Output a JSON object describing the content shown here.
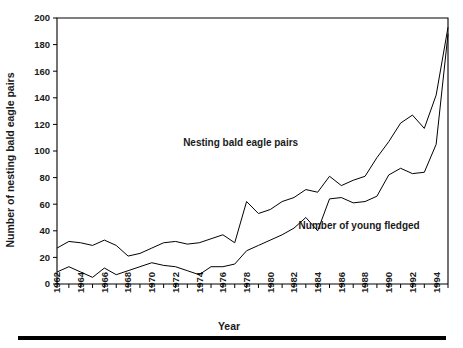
{
  "chart_data": {
    "type": "line",
    "title": "",
    "xlabel": "Year",
    "ylabel": "Number of nesting bald eagle pairs",
    "xlim": [
      1962,
      1995
    ],
    "ylim": [
      0,
      200
    ],
    "yticks": [
      0,
      20,
      40,
      60,
      80,
      100,
      120,
      140,
      160,
      180,
      200
    ],
    "ytick_labels": [
      "0",
      "20",
      "40",
      "60",
      "80",
      "100",
      "120",
      "140",
      "160",
      "180",
      "200"
    ],
    "xticks": [
      1962,
      1964,
      1966,
      1968,
      1970,
      1972,
      1974,
      1976,
      1978,
      1980,
      1982,
      1984,
      1986,
      1988,
      1990,
      1992,
      1994
    ],
    "xtick_labels": [
      "1962",
      "1964",
      "1966",
      "1968",
      "1970",
      "1972",
      "1974",
      "1976",
      "1978",
      "1980",
      "1982",
      "1984",
      "1986",
      "1988",
      "1990",
      "1992",
      "1994"
    ],
    "x": [
      1962,
      1963,
      1964,
      1965,
      1966,
      1967,
      1968,
      1969,
      1970,
      1971,
      1972,
      1973,
      1974,
      1975,
      1976,
      1977,
      1978,
      1979,
      1980,
      1981,
      1982,
      1983,
      1984,
      1985,
      1986,
      1987,
      1988,
      1989,
      1990,
      1991,
      1992,
      1993,
      1994,
      1995
    ],
    "grid": false,
    "legend_position": "inline-annotations",
    "series": [
      {
        "name": "Nesting bald eagle pairs",
        "label_x": 1977.5,
        "label_y": 104,
        "values": [
          27,
          32,
          31,
          29,
          33,
          29,
          21,
          23,
          27,
          31,
          32,
          30,
          31,
          34,
          37,
          31,
          62,
          53,
          56,
          62,
          65,
          71,
          69,
          81,
          74,
          78,
          81,
          95,
          107,
          121,
          127,
          117,
          142,
          193
        ]
      },
      {
        "name": "Number of young fledged",
        "label_x": 1987.5,
        "label_y": 41,
        "values": [
          9,
          13,
          9,
          5,
          12,
          7,
          10,
          13,
          16,
          14,
          13,
          10,
          7,
          13,
          13,
          15,
          25,
          29,
          33,
          37,
          42,
          50,
          40,
          64,
          65,
          61,
          62,
          66,
          82,
          87,
          83,
          84,
          105,
          188
        ]
      }
    ],
    "annotations": [
      {
        "text": "Nesting bald eagle pairs",
        "x": 1977.5,
        "y": 104
      },
      {
        "text": "Number of young fledged",
        "x": 1987.5,
        "y": 41
      }
    ],
    "colors": {
      "line": "#000000",
      "axis": "#000000",
      "background": "#ffffff",
      "text": "#1a1a1a"
    }
  },
  "figure": {
    "bottom_rule": "decorative-rule"
  }
}
